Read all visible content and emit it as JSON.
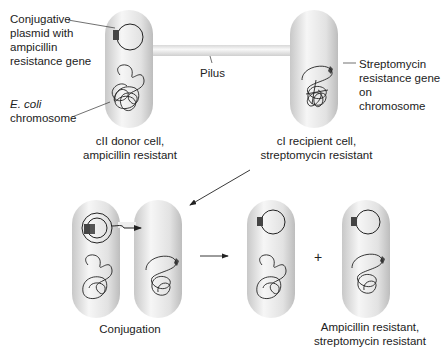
{
  "labels": {
    "plasmid": [
      "Conjugative",
      "plasmid with",
      "ampicillin",
      "resistance gene"
    ],
    "ecoli_italic": "E. coli",
    "ecoli_rest": "chromosome",
    "pilus": "Pilus",
    "strep_gene": [
      "Streptomycin",
      "resistance gene",
      "on chromosome"
    ],
    "donor": [
      "cII donor cell,",
      "ampicillin resistant"
    ],
    "recipient": [
      "cI recipient cell,",
      "streptomycin resistant"
    ],
    "conjugation": "Conjugation",
    "plus": "+",
    "result": [
      "Ampicillin resistant,",
      "streptomycin resistant"
    ]
  },
  "colors": {
    "cell": "#e4e4e4",
    "gene": "#444444",
    "line": "#222222"
  }
}
